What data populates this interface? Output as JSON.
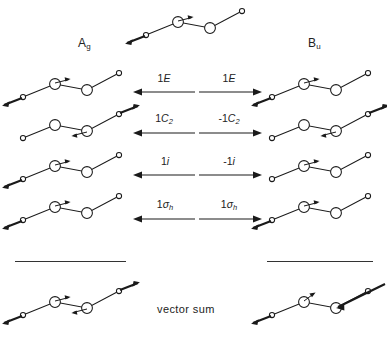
{
  "figure": {
    "type": "symmetry-operation-diagram",
    "vector_sum_label": "vector sum"
  },
  "species": {
    "left": {
      "letter": "A",
      "sub": "g",
      "full": "Ag"
    },
    "right": {
      "letter": "B",
      "sub": "u",
      "full": "Bu"
    }
  },
  "operations": [
    {
      "name": "identity",
      "left": {
        "character": "1",
        "symbol": "E",
        "sub": "",
        "text": "1E",
        "arrow": "left"
      },
      "right": {
        "character": "1",
        "symbol": "E",
        "sub": "",
        "text": "1E",
        "arrow": "right"
      }
    },
    {
      "name": "two-fold-rotation",
      "left": {
        "character": "1",
        "symbol": "C",
        "sub": "2",
        "text": "1C2",
        "arrow": "left"
      },
      "right": {
        "character": "-1",
        "symbol": "C",
        "sub": "2",
        "text": "-1C2",
        "arrow": "right"
      }
    },
    {
      "name": "inversion",
      "left": {
        "character": "1",
        "symbol": "i",
        "sub": "",
        "text": "1i",
        "arrow": "left"
      },
      "right": {
        "character": "-1",
        "symbol": "i",
        "sub": "",
        "text": "-1i",
        "arrow": "right"
      }
    },
    {
      "name": "horizontal-mirror",
      "left": {
        "character": "1",
        "symbol": "σ",
        "sub": "h",
        "text": "1σh",
        "arrow": "left"
      },
      "right": {
        "character": "1",
        "symbol": "σ",
        "sub": "h",
        "text": "1σh",
        "arrow": "right"
      }
    }
  ],
  "molecules": {
    "top": {
      "position": "top-center",
      "variant": "base",
      "role": "parent-displacement"
    },
    "left_column": [
      {
        "row": 1,
        "variant": "base"
      },
      {
        "row": 2,
        "variant": "rotated"
      },
      {
        "row": 3,
        "variant": "base"
      },
      {
        "row": 4,
        "variant": "rotated"
      }
    ],
    "right_column": [
      {
        "row": 1,
        "variant": "base"
      },
      {
        "row": 2,
        "variant": "rotated-mirror"
      },
      {
        "row": 3,
        "variant": "base"
      },
      {
        "row": 4,
        "variant": "rotated-mirror"
      }
    ],
    "sum_left": {
      "variant": "sum-ag"
    },
    "sum_right": {
      "variant": "sum-bu"
    }
  },
  "colors": {
    "line": "#1a1a1a",
    "atom_fill": "#ffffff",
    "text": "#222222",
    "rule": "#333333"
  }
}
